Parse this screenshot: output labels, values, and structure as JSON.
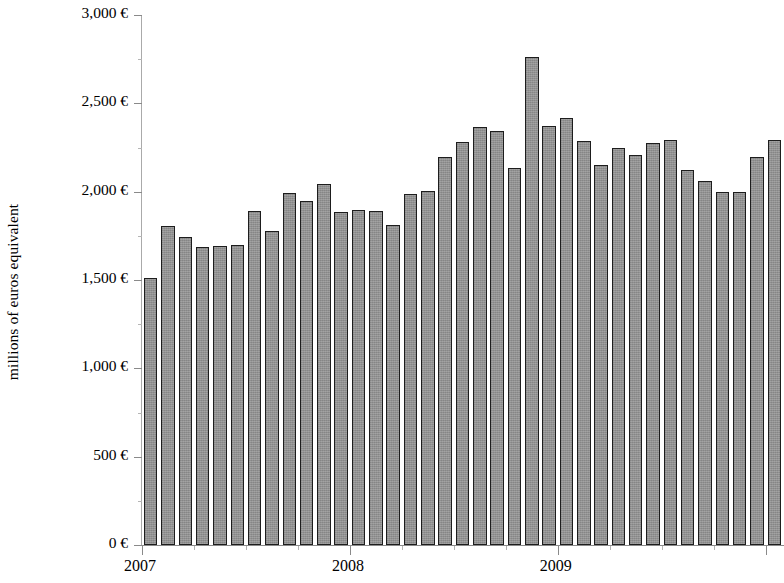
{
  "chart_data": {
    "type": "bar",
    "title": "",
    "subtitle": "",
    "xlabel": "",
    "ylabel": "millions of euros equivalent",
    "ylim": [
      0,
      3000
    ],
    "y_ticks": [
      0,
      500,
      1000,
      1500,
      2000,
      2500,
      3000
    ],
    "y_tick_labels": [
      "0 €",
      "500 €",
      "1,000 €",
      "1,500 €",
      "2,000 €",
      "2,500 €",
      "3,000 €"
    ],
    "x_tick_labels": [
      "2007",
      "2008",
      "2009"
    ],
    "grid": false,
    "legend": null,
    "bar_color": "#939393",
    "bar_edge_color": "#1d1d1d",
    "n_bars": 37,
    "categories": [
      "2007-01",
      "2007-02",
      "2007-03",
      "2007-04",
      "2007-05",
      "2007-06",
      "2007-07",
      "2007-08",
      "2007-09",
      "2007-10",
      "2007-11",
      "2007-12",
      "2008-01",
      "2008-02",
      "2008-03",
      "2008-04",
      "2008-05",
      "2008-06",
      "2008-07",
      "2008-08",
      "2008-09",
      "2008-10",
      "2008-11",
      "2008-12",
      "2009-01",
      "2009-02",
      "2009-03",
      "2009-04",
      "2009-05",
      "2009-06",
      "2009-07",
      "2009-08",
      "2009-09",
      "2009-10",
      "2009-11",
      "2009-12",
      "2010-01"
    ],
    "values": [
      1510,
      1805,
      1745,
      1685,
      1695,
      1700,
      1890,
      1775,
      1990,
      1945,
      2045,
      1885,
      1895,
      1890,
      1810,
      1985,
      2005,
      2195,
      2280,
      2365,
      2345,
      2135,
      2760,
      2370,
      2415,
      2285,
      2150,
      2245,
      2210,
      2275,
      2290,
      2120,
      2060,
      2000,
      2000,
      2195,
      2290
    ]
  },
  "axis": {
    "y_title": "millions of euros equivalent"
  }
}
